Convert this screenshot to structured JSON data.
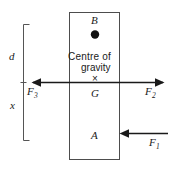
{
  "diagram": {
    "type": "free-body force diagram",
    "body": {
      "shape": "rectangle",
      "top_label": "B",
      "bottom_label": "A"
    },
    "centre_of_gravity": {
      "caption_line1": "Centre  of",
      "caption_line2": "gravity",
      "marker": "×",
      "point_label": "G"
    },
    "forces": [
      {
        "id": "F1",
        "label": "F",
        "subscript": "1",
        "direction": "left",
        "note": "applied at lower right of body"
      },
      {
        "id": "F2",
        "label": "F",
        "subscript": "2",
        "direction": "right",
        "note": "acting right through centre of gravity line"
      },
      {
        "id": "F3",
        "label": "F",
        "subscript": "3",
        "direction": "left",
        "note": "acting left through centre of gravity line"
      }
    ],
    "dimensions": [
      {
        "id": "d",
        "label": "d",
        "note": "distance from top of bracket to centre of gravity line"
      },
      {
        "id": "x",
        "label": "x",
        "note": "distance from centre of gravity line to bottom of bracket"
      }
    ],
    "colors": {
      "stroke": "#1a1a1a",
      "background": "#ffffff",
      "bracket": "#555555",
      "rect_border": "#4d4d4d"
    }
  }
}
